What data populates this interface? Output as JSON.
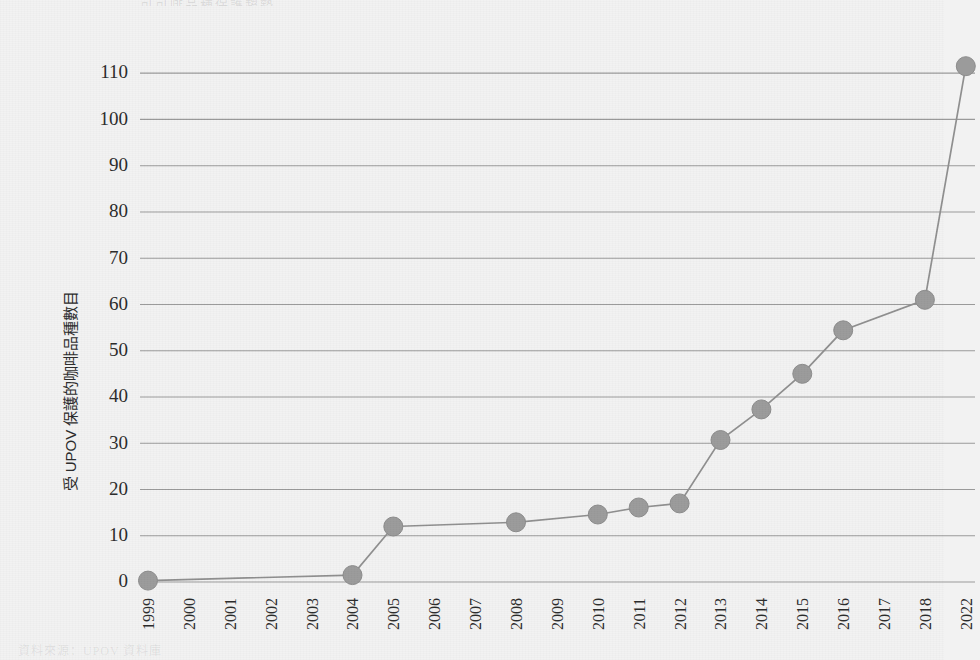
{
  "figure": {
    "ghost_title": "可可啡品種保護趨勢",
    "ghost_caption": "資料來源：UPOV 資料庫",
    "background_color": "#f2f2f2",
    "gridline_color": "#9a9a9a",
    "series_color": "#9b9b9b"
  },
  "chart_data": {
    "type": "line",
    "title": "",
    "xlabel": "",
    "ylabel": "受 UPOV 保護的咖啡品種數目",
    "categories": [
      "1999",
      "2000",
      "2001",
      "2002",
      "2003",
      "2004",
      "2005",
      "2006",
      "2007",
      "2008",
      "2009",
      "2010",
      "2011",
      "2012",
      "2013",
      "2014",
      "2015",
      "2016",
      "2017",
      "2018",
      "2022"
    ],
    "ylim": [
      0,
      115
    ],
    "yticks": [
      0,
      10,
      20,
      30,
      40,
      50,
      60,
      70,
      80,
      90,
      100,
      110
    ],
    "ytick_labels": [
      "0",
      "10",
      "20",
      "30",
      "40",
      "50",
      "60",
      "70",
      "80",
      "90",
      "100",
      "110"
    ],
    "grid": "horizontal",
    "legend": "none",
    "marker": "circle",
    "series": [
      {
        "name": "受 UPOV 保護的咖啡品種數目",
        "color": "#9b9b9b",
        "points": [
          {
            "x": "1999",
            "y": 0.3
          },
          {
            "x": "2004",
            "y": 1.5
          },
          {
            "x": "2005",
            "y": 12.0
          },
          {
            "x": "2008",
            "y": 12.9
          },
          {
            "x": "2010",
            "y": 14.6
          },
          {
            "x": "2011",
            "y": 16.1
          },
          {
            "x": "2012",
            "y": 17.0
          },
          {
            "x": "2013",
            "y": 30.7
          },
          {
            "x": "2014",
            "y": 37.3
          },
          {
            "x": "2015",
            "y": 45.0
          },
          {
            "x": "2016",
            "y": 54.4
          },
          {
            "x": "2018",
            "y": 61.0
          },
          {
            "x": "2022",
            "y": 111.5
          }
        ]
      }
    ]
  }
}
